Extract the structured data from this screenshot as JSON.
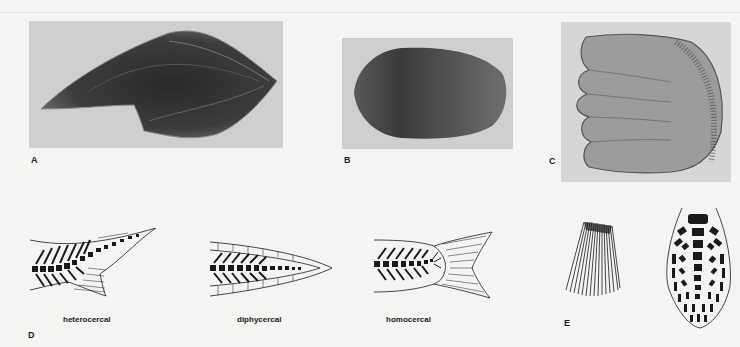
{
  "figure": {
    "panels": {
      "A": {
        "label": "A",
        "subject": "scale-photo-elongated"
      },
      "B": {
        "label": "B",
        "subject": "scale-photo-oval"
      },
      "C": {
        "label": "C",
        "subject": "scale-photo-lobed"
      },
      "D": {
        "label": "D",
        "subject": "tail-types"
      },
      "E": {
        "label": "E",
        "subject": "fin-rays-and-skeleton"
      }
    },
    "tail_types": [
      {
        "caption": "heterocercal"
      },
      {
        "caption": "diphycercal"
      },
      {
        "caption": "homocercal"
      }
    ],
    "colors": {
      "background": "#f4f4f3",
      "photo_bg": "#cfcfcd",
      "ink": "#1a1a1a"
    }
  }
}
